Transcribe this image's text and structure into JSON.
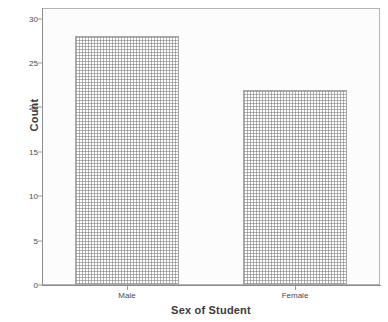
{
  "chart_data": {
    "type": "bar",
    "title": "",
    "categories": [
      "Male",
      "Female"
    ],
    "values": [
      28,
      22
    ],
    "xlabel": "Sex of Student",
    "ylabel": "Count",
    "ylim": [
      0,
      31.2
    ],
    "yticks": [
      0,
      5,
      10,
      15,
      20,
      25,
      30
    ],
    "ytick_labels": [
      "0",
      "5",
      "10",
      "15",
      "20",
      "25",
      "30"
    ],
    "grid": false,
    "legend": "none",
    "series": [
      {
        "name": "Count",
        "values": [
          28,
          22
        ]
      }
    ],
    "bar_fill": "dotted-stipple",
    "bar_fill_color": "#fdfdfd",
    "bar_border_color": "#a6a6a6",
    "plot_background": "#fcfcfc",
    "frame_color": "#b4b4b4",
    "axis_color": "#8c8c8c",
    "text_color": "#3a3a3a"
  },
  "axes": {
    "y_title": "Count",
    "x_title": "Sex of Student"
  }
}
